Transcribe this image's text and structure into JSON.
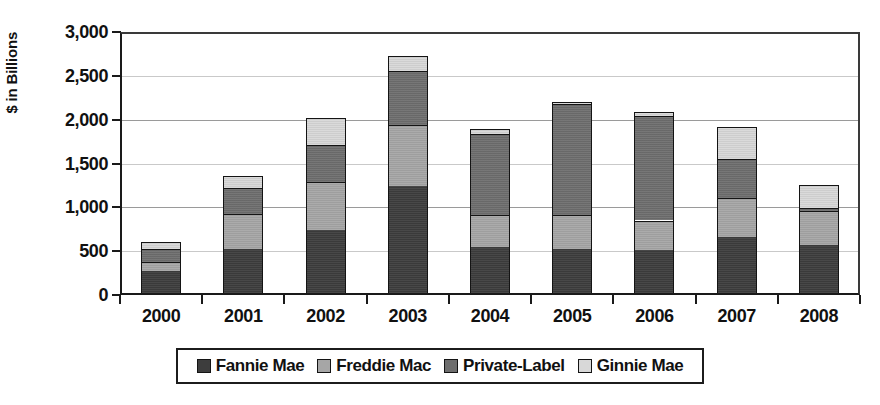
{
  "chart_data": {
    "type": "bar",
    "stacked": true,
    "title": "",
    "xlabel": "",
    "ylabel": "$ in Billions",
    "ylim": [
      0,
      3000
    ],
    "ytick_step": 500,
    "ytick_labels": [
      "3,000",
      "2,500",
      "2,000",
      "1,500",
      "1,000",
      "500",
      "0"
    ],
    "ytick_values": [
      3000,
      2500,
      2000,
      1500,
      1000,
      500,
      0
    ],
    "grid": true,
    "grid_axis": "y",
    "legend_position": "bottom",
    "categories": [
      "2000",
      "2001",
      "2002",
      "2003",
      "2004",
      "2005",
      "2006",
      "2007",
      "2008"
    ],
    "series": [
      {
        "name": "Fannie Mae",
        "color": "#3d3d3d",
        "values": [
          270,
          520,
          745,
          1240,
          545,
          520,
          510,
          660,
          570
        ]
      },
      {
        "name": "Freddie Mac",
        "color": "#a6a6a6",
        "values": [
          105,
          405,
          545,
          700,
          365,
          390,
          340,
          450,
          385
        ]
      },
      {
        "name": "Private-Label",
        "color": "#6e6e6e",
        "values": [
          155,
          295,
          420,
          620,
          925,
          1265,
          1190,
          440,
          40
        ]
      },
      {
        "name": "Ginnie Mae",
        "color": "#d8d8d8",
        "values": [
          80,
          135,
          310,
          170,
          60,
          25,
          50,
          370,
          265
        ]
      }
    ],
    "totals": [
      610,
      1355,
      2020,
      2730,
      1895,
      2200,
      2090,
      1920,
      1260
    ]
  },
  "axis": {
    "y_title": "$ in Billions"
  },
  "legend": {
    "entries": [
      {
        "label": "Fannie Mae",
        "swatch": "fannie"
      },
      {
        "label": "Freddie Mac",
        "swatch": "freddie"
      },
      {
        "label": "Private-Label",
        "swatch": "private"
      },
      {
        "label": "Ginnie Mae",
        "swatch": "ginnie"
      }
    ]
  }
}
